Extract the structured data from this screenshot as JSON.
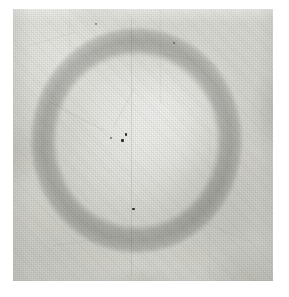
{
  "image": {
    "title": "Scanned paper plate with faint circular ring",
    "subject": "circular-ring-on-textured-paper",
    "medium": "halftone scan / photographic plate",
    "canvas": {
      "width": 289,
      "height": 297,
      "background_color": "#ffffff"
    },
    "plate": {
      "x": 13,
      "y": 9,
      "width": 260,
      "height": 272,
      "base_color": "#dcdcd6",
      "light_color": "#eceae4",
      "shadow_color": "#c9c9c3"
    },
    "ring": {
      "name": "faint-circular-ring",
      "center_x": 137,
      "center_y": 140,
      "outer_width": 213,
      "outer_height": 227,
      "band_color": "#b9bbb7",
      "interior_color": "#e8e8e4",
      "exterior_color": "#d8d8d2",
      "band_thickness_px": 22,
      "opacity": 0.4
    },
    "texture": {
      "pattern": "halftone-dither-grid",
      "cell_size_px": 2,
      "grain_color": "#78786f"
    },
    "marks": [
      {
        "name": "speck",
        "x": 125,
        "y": 133,
        "size": 3
      },
      {
        "name": "speck",
        "x": 121,
        "y": 139,
        "size": 3
      },
      {
        "name": "speck",
        "x": 132,
        "y": 208,
        "size": 3
      },
      {
        "name": "crease",
        "x": 131,
        "y": 19,
        "length": 258,
        "orientation": "vertical"
      }
    ]
  }
}
